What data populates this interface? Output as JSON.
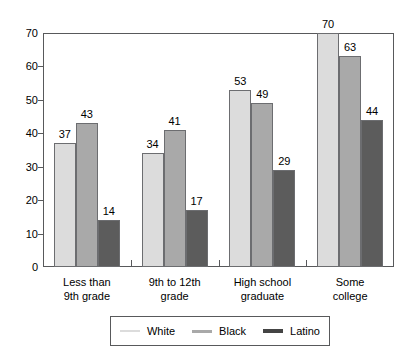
{
  "chart_data": {
    "type": "bar",
    "title": "",
    "subtitle": "",
    "xlabel": "",
    "ylabel": "",
    "ylim": [
      0,
      70
    ],
    "y_ticks": [
      0,
      10,
      20,
      30,
      40,
      50,
      60,
      70
    ],
    "grid": false,
    "legend_position": "bottom",
    "categories": [
      "Less than\n9th grade",
      "9th to 12th\ngrade",
      "High school\ngraduate",
      "Some\ncollege"
    ],
    "category_lines": [
      [
        "Less than",
        "9th grade"
      ],
      [
        "9th to 12th",
        "grade"
      ],
      [
        "High school",
        "graduate"
      ],
      [
        "Some",
        "college"
      ]
    ],
    "series": [
      {
        "name": "White",
        "color": "#dcdcdc",
        "values": [
          37,
          34,
          53,
          70
        ]
      },
      {
        "name": "Black",
        "color": "#a9a9a9",
        "values": [
          43,
          41,
          49,
          63
        ]
      },
      {
        "name": "Latino",
        "color": "#5c5c5c",
        "values": [
          14,
          17,
          29,
          44
        ]
      }
    ],
    "bar_labels_shown": true
  },
  "legend": {
    "entries": [
      {
        "label": "White",
        "swatch": "legend-line-white",
        "color": "#dcdcdc",
        "thickness": 2
      },
      {
        "label": "Black",
        "swatch": "legend-line-black",
        "color": "#a9a9a9",
        "thickness": 3
      },
      {
        "label": "Latino",
        "swatch": "legend-line-latino",
        "color": "#444444",
        "thickness": 4
      }
    ]
  },
  "axis": {
    "y_tick_labels": [
      "0",
      "10",
      "20",
      "30",
      "40",
      "50",
      "60",
      "70"
    ]
  },
  "colors": {
    "frame": "#58595b",
    "bar_border": "#6c6d70",
    "text": "#000000",
    "background": "#ffffff"
  }
}
